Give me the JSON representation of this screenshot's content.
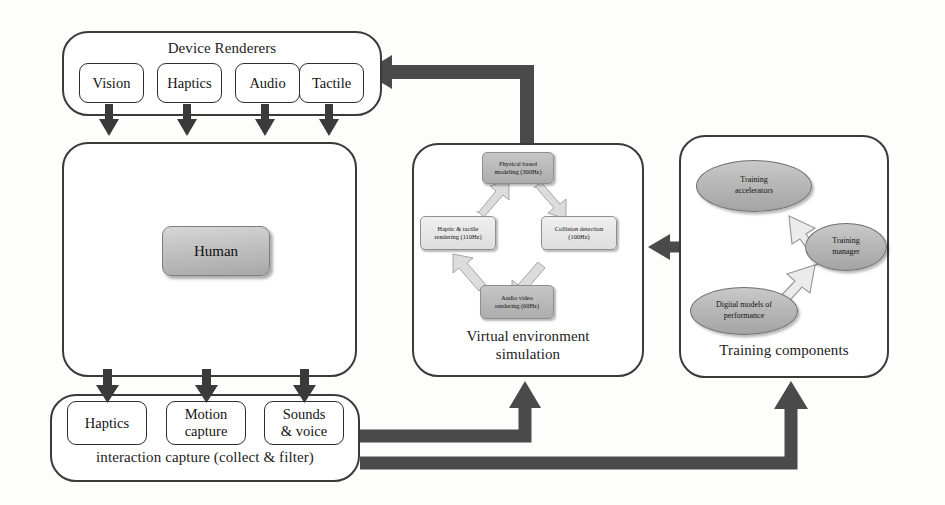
{
  "diagram": {
    "colors": {
      "thick_arrow": "#4a4a4a",
      "thin_arrow": "#3a3a3a",
      "cycle_arrow": "#d9d9d9",
      "cycle_arrow_stroke": "#9e9e9e",
      "panel_border": "#3a3a3a",
      "node_dark": "#b5b5b5",
      "node_light": "#e6e6e6",
      "ellipse_fill": "#b8b8b8"
    }
  },
  "device_renderers": {
    "label": "Device Renderers",
    "items": [
      {
        "label": "Vision"
      },
      {
        "label": "Haptics"
      },
      {
        "label": "Audio"
      },
      {
        "label": "Tactile"
      }
    ]
  },
  "human_panel": {
    "human_label": "Human"
  },
  "virtual_environment": {
    "label_line1": "Virtual environment",
    "label_line2": "simulation",
    "nodes": [
      {
        "line1": "Physical based",
        "line2": "modeling (300Hz)",
        "tone": "dark"
      },
      {
        "line1": "Collision detection",
        "line2": "(100Hz)",
        "tone": "light"
      },
      {
        "line1": "Audio video",
        "line2": "rendering (60Hz)",
        "tone": "dark"
      },
      {
        "line1": "Haptic & tactile",
        "line2": "rendering (110Hz)",
        "tone": "light"
      }
    ]
  },
  "training_components": {
    "label": "Training components",
    "nodes": [
      {
        "line1": "Training",
        "line2": "accelerators"
      },
      {
        "line1": "Training",
        "line2": "manager"
      },
      {
        "line1": "Digital models of",
        "line2": "performance"
      }
    ]
  },
  "interaction_capture": {
    "label": "interaction capture (collect & filter)",
    "items": [
      {
        "line1": "Haptics",
        "line2": ""
      },
      {
        "line1": "Motion",
        "line2": "capture"
      },
      {
        "line1": "Sounds",
        "line2": "& voice"
      }
    ]
  }
}
